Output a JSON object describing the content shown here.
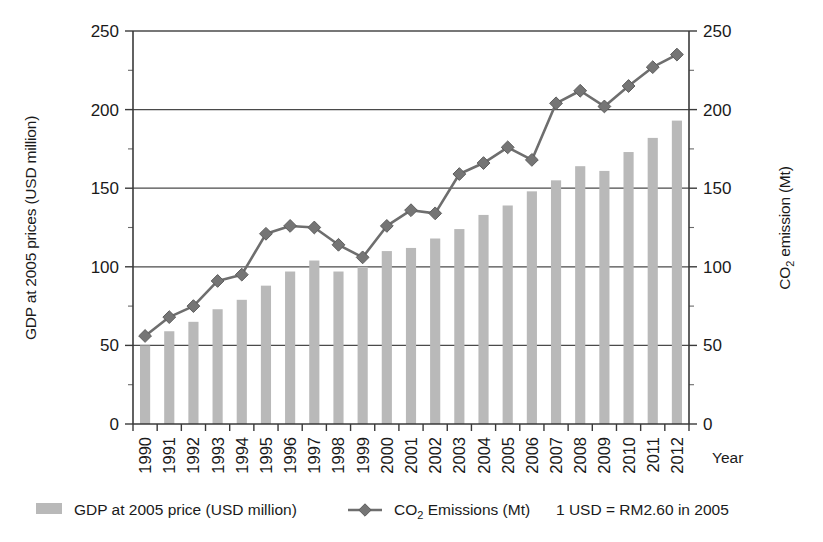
{
  "chart_data": {
    "type": "bar",
    "title": "",
    "subtitle": "",
    "xlabel": "Year",
    "ylabel": "GDP at 2005 prices (USD million)",
    "ylabel_right": "CO2 emission (Mt)",
    "ylabel_right_parts": {
      "pre": "CO",
      "sub": "2",
      "post": " emission (Mt)"
    },
    "grid": true,
    "legend_position": "bottom",
    "ylim": [
      0,
      250
    ],
    "ylim_right": [
      0,
      250
    ],
    "yticks": [
      0,
      50,
      100,
      150,
      200,
      250
    ],
    "yticks_right": [
      0,
      50,
      100,
      150,
      200,
      250
    ],
    "ytick_labels": [
      "0",
      "50",
      "100",
      "150",
      "200",
      "250"
    ],
    "ytick_labels_right": [
      "0",
      "50",
      "100",
      "150",
      "200",
      "250"
    ],
    "categories": [
      "1990",
      "1991",
      "1992",
      "1993",
      "1994",
      "1995",
      "1996",
      "1997",
      "1998",
      "1999",
      "2000",
      "2001",
      "2002",
      "2003",
      "2004",
      "2005",
      "2006",
      "2007",
      "2008",
      "2009",
      "2010",
      "2011",
      "2012"
    ],
    "series": [
      {
        "name": "GDP at 2005 price (USD million)",
        "type": "bar",
        "axis": "left",
        "color": "#b9b9b9",
        "values": [
          50,
          59,
          65,
          73,
          79,
          88,
          97,
          104,
          97,
          100,
          110,
          112,
          118,
          124,
          133,
          139,
          148,
          155,
          164,
          161,
          173,
          182,
          193
        ]
      },
      {
        "name": "CO2 Emissions (Mt)",
        "type": "line",
        "axis": "right",
        "color": "#757575",
        "marker": "diamond",
        "values": [
          56,
          68,
          75,
          91,
          95,
          121,
          126,
          125,
          114,
          106,
          126,
          136,
          134,
          159,
          166,
          176,
          168,
          204,
          212,
          202,
          215,
          227,
          235
        ]
      }
    ],
    "annotations": [
      "1 USD = RM2.60 in 2005"
    ]
  },
  "legend": {
    "items": [
      {
        "label": "GDP at 2005 price (USD million)",
        "marker": "swatch",
        "color": "#b9b9b9"
      },
      {
        "label_pre": "CO",
        "label_sub": "2",
        "label_post": " Emissions (Mt)",
        "marker": "line-diamond",
        "color": "#757575"
      }
    ],
    "note": "1 USD = RM2.60 in 2005"
  },
  "axes": {
    "left_title": "GDP at 2005 prices (USD million)",
    "right_title_pre": "CO",
    "right_title_sub": "2",
    "right_title_post": " emission (Mt)",
    "x_title": "Year"
  }
}
